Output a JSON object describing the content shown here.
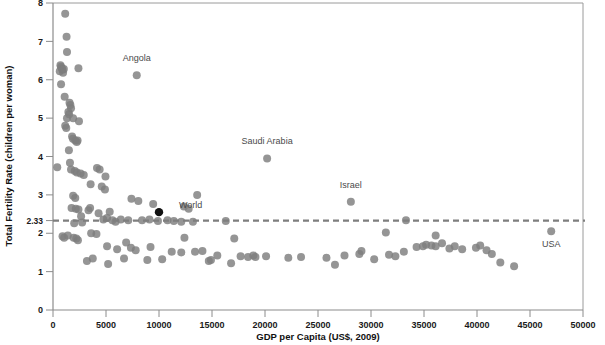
{
  "chart_data": {
    "type": "scatter",
    "title": "",
    "xlabel": "GDP per Capita (US$, 2009)",
    "ylabel": "Total Fertility Rate (children per woman)",
    "xlim": [
      0,
      50000
    ],
    "ylim": [
      0,
      8
    ],
    "grid": false,
    "legend": null,
    "xticks": [
      0,
      5000,
      10000,
      15000,
      20000,
      25000,
      30000,
      35000,
      40000,
      45000,
      50000
    ],
    "xtick_labels": [
      "0",
      "5000",
      "10000",
      "15000",
      "20000",
      "25000",
      "30000",
      "35000",
      "40000",
      "45000",
      "50000"
    ],
    "yticks": [
      0,
      1,
      2,
      2.33,
      3,
      4,
      5,
      6,
      7,
      8
    ],
    "ytick_labels": [
      "0",
      "1",
      "2",
      "2.33",
      "3",
      "4",
      "5",
      "6",
      "7",
      "8"
    ],
    "reference_line": {
      "orientation": "horizontal",
      "value": 2.33,
      "label": "2.33",
      "style": "dashed",
      "color": "#7e7e7e"
    },
    "marker_color": "#7e7e7e",
    "highlight_marker_color": "#111111",
    "annotations": [
      {
        "label": "Angola",
        "x": 7900,
        "y": 6.12,
        "label_dx": 0,
        "label_dy": -14,
        "highlight": false
      },
      {
        "label": "Saudi Arabia",
        "x": 20200,
        "y": 3.95,
        "label_dx": 0,
        "label_dy": -14,
        "highlight": false
      },
      {
        "label": "Israel",
        "x": 28100,
        "y": 2.82,
        "label_dx": 0,
        "label_dy": -14,
        "highlight": false
      },
      {
        "label": "World",
        "x": 10000,
        "y": 2.55,
        "label_dx": 20,
        "label_dy": -4,
        "highlight": true
      },
      {
        "label": "USA",
        "x": 47000,
        "y": 2.05,
        "label_dx": 0,
        "label_dy": 16,
        "highlight": false
      }
    ],
    "points": [
      [
        1150,
        7.72
      ],
      [
        1280,
        7.12
      ],
      [
        1320,
        6.72
      ],
      [
        700,
        6.38
      ],
      [
        760,
        6.34
      ],
      [
        830,
        6.3
      ],
      [
        890,
        6.26
      ],
      [
        640,
        6.22
      ],
      [
        950,
        6.18
      ],
      [
        1020,
        6.28
      ],
      [
        2400,
        6.3
      ],
      [
        7900,
        6.12
      ],
      [
        760,
        5.88
      ],
      [
        1100,
        5.56
      ],
      [
        1560,
        5.4
      ],
      [
        1640,
        5.34
      ],
      [
        1700,
        5.26
      ],
      [
        1450,
        5.16
      ],
      [
        1520,
        5.1
      ],
      [
        1320,
        5.0
      ],
      [
        1900,
        5.0
      ],
      [
        2450,
        4.92
      ],
      [
        1150,
        4.8
      ],
      [
        1250,
        4.74
      ],
      [
        1800,
        4.52
      ],
      [
        1880,
        4.46
      ],
      [
        2100,
        4.42
      ],
      [
        2240,
        4.38
      ],
      [
        2320,
        4.42
      ],
      [
        1500,
        4.16
      ],
      [
        400,
        3.72
      ],
      [
        1700,
        3.66
      ],
      [
        2050,
        3.62
      ],
      [
        2250,
        3.58
      ],
      [
        2600,
        3.56
      ],
      [
        4150,
        3.7
      ],
      [
        4400,
        3.66
      ],
      [
        2900,
        3.52
      ],
      [
        4950,
        3.48
      ],
      [
        20200,
        3.95
      ],
      [
        3550,
        3.28
      ],
      [
        4600,
        3.22
      ],
      [
        4900,
        3.14
      ],
      [
        13600,
        3.0
      ],
      [
        1900,
        2.98
      ],
      [
        2100,
        2.92
      ],
      [
        1750,
        2.66
      ],
      [
        2150,
        2.64
      ],
      [
        2400,
        2.62
      ],
      [
        3350,
        2.6
      ],
      [
        3500,
        2.66
      ],
      [
        4300,
        2.52
      ],
      [
        5350,
        2.56
      ],
      [
        7400,
        2.9
      ],
      [
        8050,
        2.84
      ],
      [
        9450,
        2.76
      ],
      [
        10000,
        2.55
      ],
      [
        12350,
        2.7
      ],
      [
        12800,
        2.64
      ],
      [
        28100,
        2.82
      ],
      [
        2650,
        2.44
      ],
      [
        4750,
        2.36
      ],
      [
        5100,
        2.4
      ],
      [
        6400,
        2.36
      ],
      [
        7100,
        2.34
      ],
      [
        8400,
        2.34
      ],
      [
        9100,
        2.36
      ],
      [
        9900,
        2.32
      ],
      [
        10800,
        2.34
      ],
      [
        11400,
        2.32
      ],
      [
        12100,
        2.3
      ],
      [
        13200,
        2.3
      ],
      [
        33300,
        2.34
      ],
      [
        47000,
        2.05
      ],
      [
        900,
        1.92
      ],
      [
        1050,
        1.88
      ],
      [
        1400,
        1.94
      ],
      [
        1950,
        1.88
      ],
      [
        2200,
        1.86
      ],
      [
        2350,
        1.82
      ],
      [
        3600,
        2.0
      ],
      [
        12400,
        1.88
      ],
      [
        31400,
        2.02
      ],
      [
        36100,
        1.94
      ],
      [
        5100,
        1.66
      ],
      [
        6050,
        1.58
      ],
      [
        7350,
        1.62
      ],
      [
        7800,
        1.56
      ],
      [
        9200,
        1.64
      ],
      [
        11200,
        1.52
      ],
      [
        12100,
        1.5
      ],
      [
        13400,
        1.52
      ],
      [
        14100,
        1.54
      ],
      [
        15500,
        1.42
      ],
      [
        17700,
        1.4
      ],
      [
        18400,
        1.38
      ],
      [
        18900,
        1.42
      ],
      [
        19100,
        1.38
      ],
      [
        20100,
        1.4
      ],
      [
        22200,
        1.36
      ],
      [
        23400,
        1.38
      ],
      [
        25800,
        1.36
      ],
      [
        29100,
        1.54
      ],
      [
        30300,
        1.32
      ],
      [
        31700,
        1.44
      ],
      [
        32300,
        1.4
      ],
      [
        33100,
        1.52
      ],
      [
        34300,
        1.64
      ],
      [
        34900,
        1.66
      ],
      [
        35200,
        1.7
      ],
      [
        35700,
        1.68
      ],
      [
        36100,
        1.66
      ],
      [
        36700,
        1.74
      ],
      [
        37400,
        1.6
      ],
      [
        37900,
        1.66
      ],
      [
        38600,
        1.58
      ],
      [
        39900,
        1.62
      ],
      [
        40300,
        1.68
      ],
      [
        40900,
        1.56
      ],
      [
        43500,
        1.14
      ],
      [
        16800,
        1.22
      ],
      [
        14700,
        1.28
      ],
      [
        5200,
        1.2
      ],
      [
        26600,
        1.18
      ],
      [
        3200,
        1.28
      ],
      [
        3750,
        1.34
      ],
      [
        6700,
        1.34
      ],
      [
        8900,
        1.3
      ],
      [
        10300,
        1.32
      ],
      [
        14900,
        1.3
      ],
      [
        1600,
        3.84
      ],
      [
        2000,
        2.26
      ],
      [
        2750,
        2.28
      ],
      [
        6900,
        1.76
      ],
      [
        5600,
        2.34
      ],
      [
        5900,
        2.3
      ],
      [
        16300,
        2.32
      ],
      [
        17100,
        1.86
      ],
      [
        4100,
        1.98
      ],
      [
        27500,
        1.42
      ],
      [
        28900,
        1.46
      ],
      [
        41400,
        1.46
      ],
      [
        42200,
        1.24
      ]
    ]
  }
}
